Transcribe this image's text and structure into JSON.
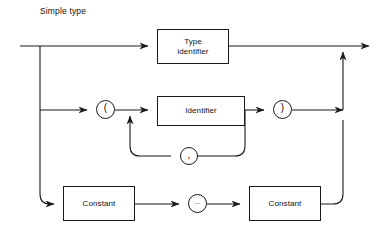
{
  "diagram": {
    "caption": "Simple type",
    "type": "railroad-syntax-diagram",
    "stroke_color": "#1a1a1a",
    "background_color": "#ffffff",
    "nodes": [
      {
        "id": "type-identifier",
        "kind": "box",
        "label": "Type\nidentifier",
        "line1": "Type",
        "line2": "identifier",
        "x": 157,
        "y": 29,
        "w": 72,
        "h": 35
      },
      {
        "id": "lparen",
        "kind": "circle",
        "label": "(",
        "x": 96,
        "y": 100,
        "d": 19
      },
      {
        "id": "identifier",
        "kind": "box",
        "label": "Identifier",
        "x": 157,
        "y": 96,
        "w": 88,
        "h": 30
      },
      {
        "id": "rparen",
        "kind": "circle",
        "label": ")",
        "x": 273,
        "y": 100,
        "d": 19
      },
      {
        "id": "comma",
        "kind": "circle",
        "label": ",",
        "x": 180,
        "y": 147,
        "d": 18
      },
      {
        "id": "constant-lower",
        "kind": "box",
        "label": "Constant",
        "x": 63,
        "y": 186,
        "w": 72,
        "h": 35
      },
      {
        "id": "range-dots",
        "kind": "circle",
        "label": "..",
        "x": 188,
        "y": 194,
        "d": 19
      },
      {
        "id": "constant-upper",
        "kind": "box",
        "label": "Constant",
        "x": 249,
        "y": 186,
        "w": 72,
        "h": 35
      }
    ],
    "rails": {
      "entry_x": 20,
      "exit_x": 370,
      "top_rail_y": 46,
      "paren_rail_y": 110,
      "loop_rail_y": 156,
      "constant_rail_y": 204,
      "left_branch_x": 40,
      "right_merge_x": 343
    },
    "alternatives": [
      "Type identifier",
      "( Identifier { , Identifier } )",
      "Constant .. Constant"
    ]
  }
}
